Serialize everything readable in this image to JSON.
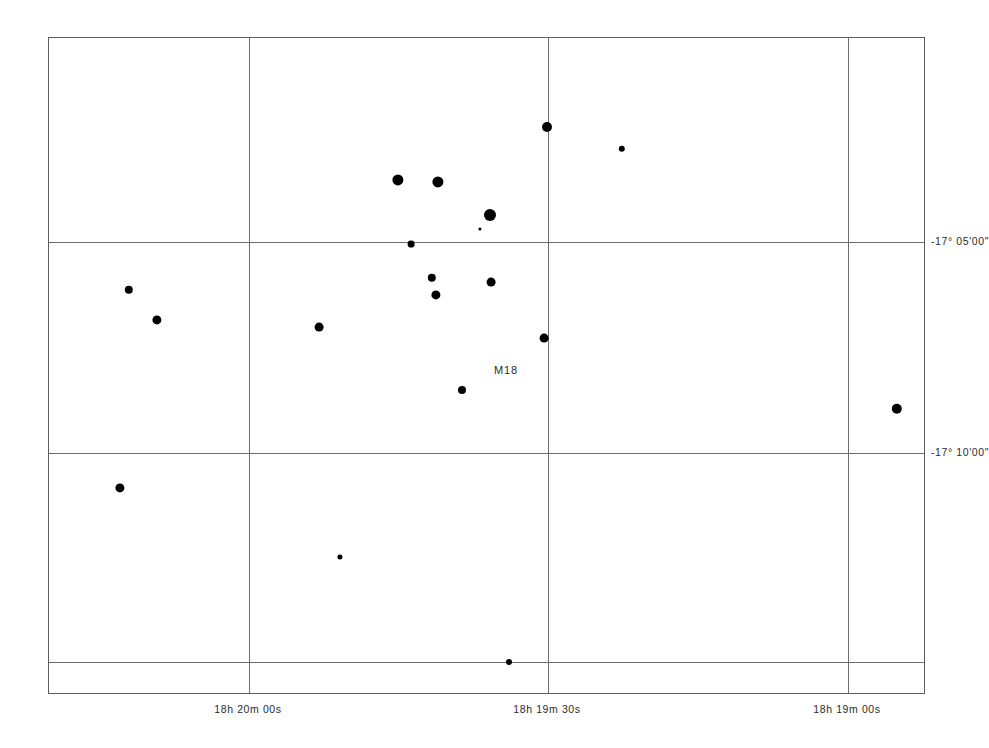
{
  "chart_data": {
    "type": "scatter",
    "title": "",
    "subtitle": "",
    "xlabel": "",
    "ylabel": "",
    "grid": true,
    "legend": "none",
    "projection": "equatorial",
    "x_axis": {
      "name": "Right Ascension",
      "direction": "decreasing-rightward",
      "ticks": [
        {
          "label": "18h 20m 00s",
          "px": 248
        },
        {
          "label": "18h 19m 30s",
          "px": 547
        },
        {
          "label": "18h 19m 00s",
          "px": 847
        }
      ]
    },
    "y_axis": {
      "name": "Declination",
      "direction": "decreasing-downward",
      "ticks": [
        {
          "label": "-17° 05'00\"",
          "px": 241
        },
        {
          "label": "-17° 10'00\"",
          "px": 452
        },
        {
          "label": "",
          "px": 661
        }
      ]
    },
    "annotations": [
      {
        "text": "M18",
        "x": 505,
        "y": 369
      }
    ],
    "points": [
      {
        "x": 546,
        "y": 126,
        "r": 5.0
      },
      {
        "x": 621,
        "y": 148,
        "r": 3.2
      },
      {
        "x": 397,
        "y": 179,
        "r": 5.6
      },
      {
        "x": 437,
        "y": 181,
        "r": 5.6
      },
      {
        "x": 489,
        "y": 214,
        "r": 6.0
      },
      {
        "x": 479,
        "y": 228,
        "r": 1.6
      },
      {
        "x": 410,
        "y": 243,
        "r": 3.4
      },
      {
        "x": 128,
        "y": 289,
        "r": 4.2
      },
      {
        "x": 431,
        "y": 277,
        "r": 4.2
      },
      {
        "x": 490,
        "y": 281,
        "r": 4.4
      },
      {
        "x": 435,
        "y": 294,
        "r": 4.6
      },
      {
        "x": 156,
        "y": 319,
        "r": 4.6
      },
      {
        "x": 318,
        "y": 326,
        "r": 4.4
      },
      {
        "x": 543,
        "y": 337,
        "r": 4.4
      },
      {
        "x": 461,
        "y": 389,
        "r": 4.0
      },
      {
        "x": 896,
        "y": 408,
        "r": 5.2
      },
      {
        "x": 119,
        "y": 487,
        "r": 4.6
      },
      {
        "x": 339,
        "y": 556,
        "r": 2.6
      },
      {
        "x": 508,
        "y": 661,
        "r": 3.0
      }
    ]
  },
  "frame": {
    "left": 48,
    "top": 37,
    "width": 877,
    "height": 657
  }
}
